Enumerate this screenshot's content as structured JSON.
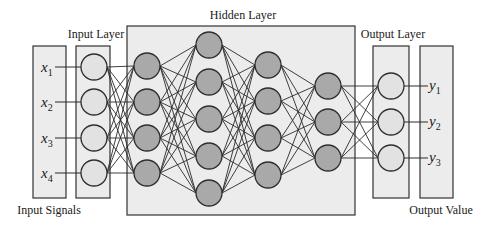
{
  "labels": {
    "input_signals": "Input Signals",
    "input_layer": "Input Layer",
    "hidden_layer": "Hidden Layer",
    "output_layer": "Output Layer",
    "output_value": "Output Value"
  },
  "inputs": [
    {
      "var": "x",
      "sub": "1"
    },
    {
      "var": "x",
      "sub": "2"
    },
    {
      "var": "x",
      "sub": "3"
    },
    {
      "var": "x",
      "sub": "4"
    }
  ],
  "outputs": [
    {
      "var": "y",
      "sub": "1"
    },
    {
      "var": "y",
      "sub": "2"
    },
    {
      "var": "y",
      "sub": "3"
    }
  ],
  "colors": {
    "panel_fill": "#ececec",
    "panel_stroke": "#333333",
    "io_node_fill": "#e2e2e2",
    "hidden_node_fill": "#a9a9a9",
    "node_stroke": "#2e2e2e",
    "edge": "#2a2a2a"
  },
  "network": {
    "radius": 13,
    "layers": [
      {
        "name": "input",
        "x": 94,
        "ys": [
          67,
          102,
          138,
          173
        ],
        "kind": "io"
      },
      {
        "name": "hidden-1",
        "x": 147,
        "ys": [
          66,
          102,
          138,
          173
        ],
        "kind": "hidden"
      },
      {
        "name": "hidden-2",
        "x": 209,
        "ys": [
          45,
          82,
          119,
          156,
          193
        ],
        "kind": "hidden"
      },
      {
        "name": "hidden-3",
        "x": 268,
        "ys": [
          65,
          101,
          138,
          175
        ],
        "kind": "hidden"
      },
      {
        "name": "hidden-4",
        "x": 328,
        "ys": [
          86,
          122,
          158
        ],
        "kind": "hidden"
      },
      {
        "name": "output",
        "x": 391,
        "ys": [
          86,
          122,
          158
        ],
        "kind": "io"
      }
    ]
  }
}
